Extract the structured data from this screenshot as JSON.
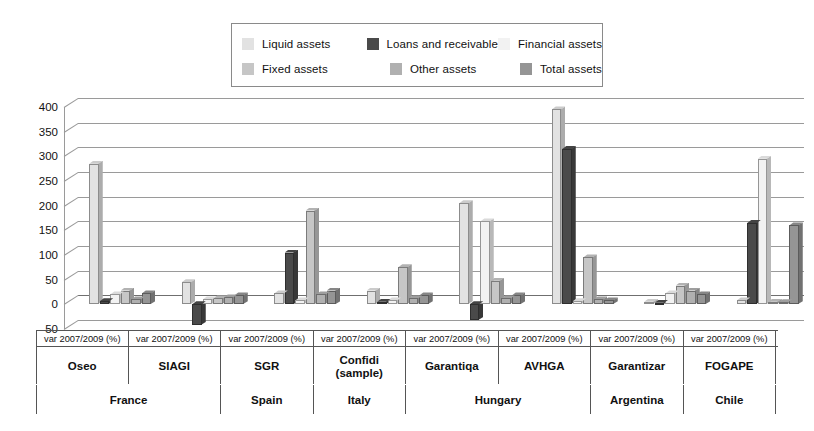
{
  "legend": {
    "items": [
      {
        "label": "Liquid assets",
        "color": "#e2e2e2",
        "key": "liquid"
      },
      {
        "label": "Loans and receivable",
        "color": "#4a4a4a",
        "key": "loans"
      },
      {
        "label": "Financial assets",
        "color": "#f2f2f2",
        "key": "financial"
      },
      {
        "label": "Fixed assets",
        "color": "#c6c6c6",
        "key": "fixed"
      },
      {
        "label": "Other assets",
        "color": "#b0b0b0",
        "key": "other"
      },
      {
        "label": "Total assets",
        "color": "#959595",
        "key": "total"
      }
    ],
    "rows": [
      [
        0,
        1,
        2
      ],
      [
        3,
        4,
        5
      ]
    ]
  },
  "axis": {
    "ticks": [
      "400",
      "350",
      "300",
      "250",
      "200",
      "150",
      "100",
      "50",
      "0",
      "-50"
    ],
    "tick_values": [
      400,
      350,
      300,
      250,
      200,
      150,
      100,
      50,
      0,
      -50
    ],
    "ymin": -50,
    "ymax": 400
  },
  "columns": {
    "var_label": "var 2007/2009 (%)",
    "institutions": [
      "Oseo",
      "SIAGI",
      "SGR",
      "Confidi\n(sample)",
      "Garantiqa",
      "AVHGA",
      "Garantizar",
      "FOGAPE"
    ],
    "institution_lines": [
      [
        "Oseo"
      ],
      [
        "SIAGI"
      ],
      [
        "SGR"
      ],
      [
        "Confidi",
        "(sample)"
      ],
      [
        "Garantiqa"
      ],
      [
        "AVHGA"
      ],
      [
        "Garantizar"
      ],
      [
        "FOGAPE"
      ]
    ],
    "countries": [
      {
        "name": "France",
        "span": 2
      },
      {
        "name": "Spain",
        "span": 1
      },
      {
        "name": "Italy",
        "span": 1
      },
      {
        "name": "Hungary",
        "span": 2
      },
      {
        "name": "Argentina",
        "span": 1
      },
      {
        "name": "Chile",
        "span": 1
      }
    ]
  },
  "chart_data": {
    "type": "bar",
    "title": "",
    "subtitle": "",
    "xlabel": "",
    "ylabel": "",
    "ylim": [
      -50,
      400
    ],
    "yticks": [
      -50,
      0,
      50,
      100,
      150,
      200,
      250,
      300,
      350,
      400
    ],
    "grid": true,
    "legend_position": "top-center",
    "orientation": "vertical-grouped",
    "unit": "var 2007/2009 (%)",
    "categories": [
      "Oseo",
      "SIAGI",
      "SGR",
      "Confidi (sample)",
      "Garantiqa",
      "AVHGA",
      "Garantizar",
      "FOGAPE"
    ],
    "category_countries": [
      "France",
      "France",
      "Spain",
      "Italy",
      "Hungary",
      "Hungary",
      "Argentina",
      "Chile"
    ],
    "series": [
      {
        "name": "Liquid assets",
        "color": "#e2e2e2",
        "values": [
          285,
          45,
          22,
          28,
          205,
          395,
          5,
          8
        ]
      },
      {
        "name": "Loans and receivable",
        "color": "#4a4a4a",
        "values": [
          6,
          -42,
          105,
          5,
          -32,
          315,
          3,
          165
        ]
      },
      {
        "name": "Financial assets",
        "color": "#f2f2f2",
        "values": [
          20,
          10,
          8,
          8,
          168,
          6,
          22,
          295
        ]
      },
      {
        "name": "Fixed assets",
        "color": "#c6c6c6",
        "values": [
          28,
          12,
          190,
          75,
          48,
          95,
          38,
          5
        ]
      },
      {
        "name": "Other assets",
        "color": "#b0b0b0",
        "values": [
          10,
          14,
          20,
          12,
          12,
          10,
          28,
          4
        ]
      },
      {
        "name": "Total assets",
        "color": "#959595",
        "values": [
          22,
          18,
          28,
          18,
          18,
          8,
          20,
          160
        ]
      }
    ]
  }
}
